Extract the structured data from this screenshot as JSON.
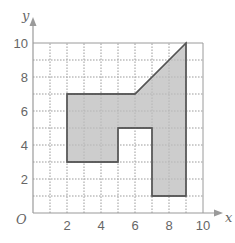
{
  "chart_data": {
    "type": "diagram",
    "title": "",
    "xlabel": "x",
    "ylabel": "y",
    "origin_label": "O",
    "xlim": [
      0,
      10
    ],
    "ylim": [
      0,
      10
    ],
    "grid": {
      "on": true,
      "step": 1,
      "style": "dotted minor, solid at 10"
    },
    "x_ticks": [
      "2",
      "4",
      "6",
      "8",
      "10"
    ],
    "y_ticks": [
      "2",
      "4",
      "6",
      "8",
      "10"
    ],
    "shape": {
      "name": "shaded polygon",
      "fill": "#c8c8c8",
      "stroke": "#555555",
      "vertices": [
        [
          2,
          7
        ],
        [
          6,
          7
        ],
        [
          9,
          10
        ],
        [
          9,
          1
        ],
        [
          7,
          1
        ],
        [
          7,
          5
        ],
        [
          5,
          5
        ],
        [
          5,
          3
        ],
        [
          2,
          3
        ]
      ]
    }
  },
  "colors": {
    "axis": "#9a9a9a",
    "grid": "#b5b5b5",
    "fill": "#c8c8c8",
    "outline": "#555555",
    "text": "#666666"
  }
}
